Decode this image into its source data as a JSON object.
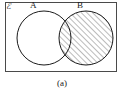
{
  "figure": {
    "caption": "(a)",
    "universal_set_label": "ℰ",
    "background_color": "#ffffff"
  },
  "diagram": {
    "type": "venn",
    "border": {
      "name": "universal-set-rectangle",
      "x": 5,
      "y": 2,
      "width": 112,
      "height": 70,
      "stroke_color": "#4a4a4a",
      "stroke_width": 1,
      "fill_color": "#ffffff"
    },
    "sets": [
      {
        "id": "A",
        "label": "A",
        "cx": 44,
        "cy": 38,
        "r": 27,
        "stroke_color": "#1a1a1a",
        "stroke_width": 1,
        "shaded": false
      },
      {
        "id": "B",
        "label": "B",
        "cx": 86,
        "cy": 38,
        "r": 27,
        "stroke_color": "#1a1a1a",
        "stroke_width": 1,
        "shaded": true
      }
    ],
    "shading": {
      "region": "B",
      "includes_intersection": true,
      "pattern": "diagonal-hatch",
      "hatch_angle_deg": 45,
      "hatch_spacing_px": 4,
      "hatch_color": "#3c3c3c",
      "hatch_stroke_width": 0.7
    }
  }
}
